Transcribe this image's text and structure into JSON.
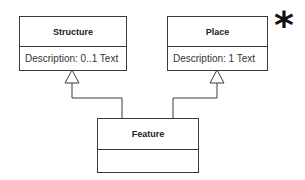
{
  "diagram": {
    "type": "uml-class-diagram",
    "classes": [
      {
        "name": "Structure",
        "attributes": [
          "Description: 0..1 Text"
        ]
      },
      {
        "name": "Place",
        "attributes": [
          "Description: 1 Text"
        ]
      },
      {
        "name": "Feature",
        "attributes": []
      }
    ],
    "relationships": [
      {
        "type": "generalization",
        "from": "Feature",
        "to": "Structure"
      },
      {
        "type": "generalization",
        "from": "Feature",
        "to": "Place"
      }
    ],
    "marker": "*"
  }
}
